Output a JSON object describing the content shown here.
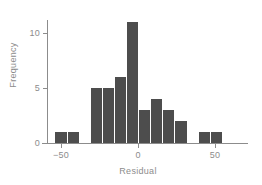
{
  "chart_data": {
    "type": "bar",
    "title": "",
    "subtitle": "",
    "xlabel": "Residual",
    "ylabel": "Frequency",
    "xlim": [
      -58,
      66
    ],
    "ylim": [
      0,
      11.6
    ],
    "grid": false,
    "legend": null,
    "bar_color": "#4d4d4d",
    "axis_color": "#8c8c8c",
    "background": "#ffffff",
    "x_ticks": [
      -50,
      0,
      50
    ],
    "x_tick_labels": [
      "−50",
      "0",
      "50"
    ],
    "y_ticks": [
      0,
      5,
      10
    ],
    "y_tick_labels": [
      "0",
      "5",
      "10"
    ],
    "bin_width": 7.8,
    "bins": [
      {
        "label": "bin-1",
        "x_left": -54.0,
        "x_right": -46.2,
        "value": 1
      },
      {
        "label": "bin-2",
        "x_left": -46.2,
        "x_right": -38.4,
        "value": 1
      },
      {
        "label": "bin-3",
        "x_left": -31.0,
        "x_right": -23.2,
        "value": 5
      },
      {
        "label": "bin-4",
        "x_left": -23.2,
        "x_right": -15.4,
        "value": 5
      },
      {
        "label": "bin-5",
        "x_left": -15.4,
        "x_right": -7.6,
        "value": 6
      },
      {
        "label": "bin-6",
        "x_left": -7.6,
        "x_right": 0.2,
        "value": 11
      },
      {
        "label": "bin-7",
        "x_left": 0.2,
        "x_right": 8.0,
        "value": 3
      },
      {
        "label": "bin-8",
        "x_left": 8.0,
        "x_right": 15.8,
        "value": 4
      },
      {
        "label": "bin-9",
        "x_left": 15.8,
        "x_right": 23.6,
        "value": 3
      },
      {
        "label": "bin-10",
        "x_left": 23.6,
        "x_right": 31.4,
        "value": 2
      },
      {
        "label": "bin-11",
        "x_left": 38.8,
        "x_right": 46.6,
        "value": 1
      },
      {
        "label": "bin-12",
        "x_left": 46.6,
        "x_right": 54.4,
        "value": 1
      }
    ],
    "categories": [
      "-54",
      "-46",
      "-31",
      "-23",
      "-15",
      "-8",
      "0",
      "8",
      "16",
      "24",
      "39",
      "47"
    ],
    "values": [
      1,
      1,
      5,
      5,
      6,
      11,
      3,
      4,
      3,
      2,
      1,
      1
    ]
  }
}
